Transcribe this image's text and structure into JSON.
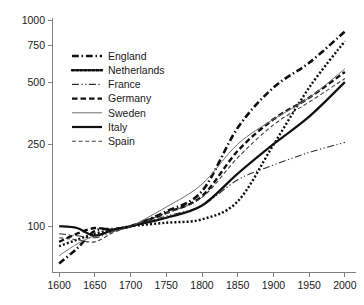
{
  "chart_data": {
    "type": "line",
    "title": "",
    "subtitle": "",
    "xlabel": "",
    "ylabel": "",
    "yscale": "log",
    "xscale": "linear",
    "xlim": [
      1590,
      2010
    ],
    "ylim": [
      60,
      1000
    ],
    "grid": false,
    "legend_position": "upper-left-inside",
    "xticks": [
      1600,
      1650,
      1700,
      1750,
      1800,
      1850,
      1900,
      1950,
      2000
    ],
    "xtick_labels": [
      "1600",
      "1650",
      "1700",
      "1750",
      "1800",
      "1850",
      "1900",
      "1950",
      "2000"
    ],
    "yticks": [
      100,
      250,
      500,
      750,
      1000
    ],
    "ytick_labels": [
      "100",
      "250",
      "500",
      "750",
      "1000"
    ],
    "x": [
      1600,
      1625,
      1650,
      1675,
      1700,
      1750,
      1800,
      1850,
      1900,
      1950,
      2000
    ],
    "series": [
      {
        "name": "England",
        "style": "dash-dot",
        "width": 2.6,
        "color": "#101010",
        "values": [
          66,
          78,
          95,
          97,
          100,
          118,
          148,
          300,
          470,
          620,
          880
        ]
      },
      {
        "name": "Netherlands",
        "style": "dotted",
        "width": 2.4,
        "color": "#101010",
        "values": [
          80,
          86,
          92,
          96,
          100,
          104,
          108,
          132,
          248,
          470,
          790
        ]
      },
      {
        "name": "France",
        "style": "dash-dot-dot",
        "width": 1.1,
        "color": "#303030",
        "values": [
          92,
          90,
          88,
          94,
          100,
          112,
          126,
          168,
          198,
          228,
          255
        ]
      },
      {
        "name": "Germany",
        "style": "dashed",
        "width": 2.4,
        "color": "#101010",
        "values": [
          84,
          92,
          98,
          96,
          100,
          116,
          140,
          232,
          330,
          420,
          560
        ]
      },
      {
        "name": "Sweden",
        "style": "solid",
        "width": 1.0,
        "color": "#707070",
        "values": [
          72,
          82,
          90,
          95,
          100,
          124,
          160,
          250,
          330,
          420,
          580
        ]
      },
      {
        "name": "Italy",
        "style": "solid",
        "width": 2.2,
        "color": "#101010",
        "values": [
          100,
          98,
          90,
          96,
          100,
          110,
          126,
          180,
          250,
          340,
          500
        ]
      },
      {
        "name": "Spain",
        "style": "dashed-thin",
        "width": 1.1,
        "color": "#404040",
        "values": [
          88,
          86,
          84,
          93,
          100,
          116,
          138,
          215,
          310,
          400,
          520
        ]
      }
    ]
  },
  "legend": {
    "entries": [
      {
        "label": "England"
      },
      {
        "label": "Netherlands"
      },
      {
        "label": "France"
      },
      {
        "label": "Germany"
      },
      {
        "label": "Sweden"
      },
      {
        "label": "Italy"
      },
      {
        "label": "Spain"
      }
    ]
  }
}
